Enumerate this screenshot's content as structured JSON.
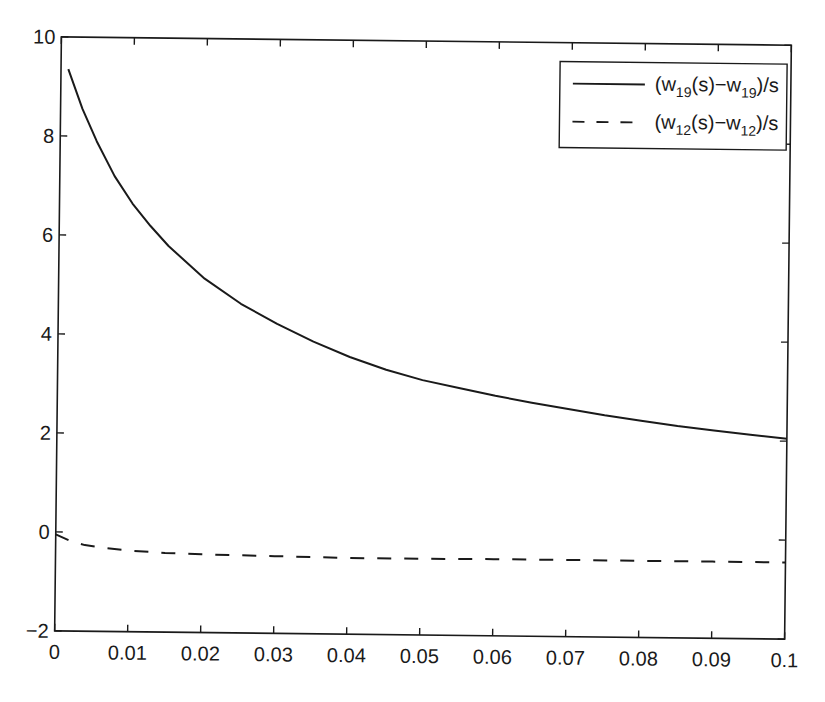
{
  "chart_data": {
    "type": "line",
    "title": "",
    "xlabel": "",
    "ylabel": "",
    "xlim": [
      0,
      0.1
    ],
    "ylim": [
      -2,
      10
    ],
    "grid": false,
    "legend_position": "upper right",
    "x_ticks": [
      "0",
      "0.01",
      "0.02",
      "0.03",
      "0.04",
      "0.05",
      "0.06",
      "0.07",
      "0.08",
      "0.09",
      "0.1"
    ],
    "y_ticks": [
      "-2",
      "0",
      "2",
      "4",
      "6",
      "8",
      "10"
    ],
    "series": [
      {
        "name": "(w19(s)-w19)/s",
        "legend": {
          "pre": "(w",
          "sub1": "19",
          "mid": "(s)−w",
          "sub2": "19",
          "post": ")/s"
        },
        "style": "solid",
        "color": "#1a1a1a",
        "x": [
          0.001,
          0.003,
          0.005,
          0.0075,
          0.01,
          0.0125,
          0.015,
          0.02,
          0.025,
          0.03,
          0.035,
          0.04,
          0.045,
          0.05,
          0.055,
          0.06,
          0.065,
          0.07,
          0.075,
          0.08,
          0.085,
          0.09,
          0.095,
          0.1
        ],
        "values": [
          9.35,
          8.55,
          7.9,
          7.2,
          6.65,
          6.2,
          5.8,
          5.15,
          4.65,
          4.25,
          3.9,
          3.6,
          3.35,
          3.15,
          3.0,
          2.85,
          2.72,
          2.6,
          2.48,
          2.38,
          2.28,
          2.2,
          2.12,
          2.05
        ]
      },
      {
        "name": "(w12(s)-w12)/s",
        "legend": {
          "pre": "(w",
          "sub1": "12",
          "mid": "(s)−w",
          "sub2": "12",
          "post": ")/s"
        },
        "style": "dashed",
        "color": "#1a1a1a",
        "x": [
          0.0,
          0.002,
          0.004,
          0.007,
          0.01,
          0.015,
          0.02,
          0.03,
          0.04,
          0.05,
          0.06,
          0.07,
          0.08,
          0.09,
          0.1
        ],
        "values": [
          -0.05,
          -0.18,
          -0.26,
          -0.32,
          -0.36,
          -0.4,
          -0.42,
          -0.44,
          -0.46,
          -0.46,
          -0.45,
          -0.45,
          -0.45,
          -0.45,
          -0.45
        ]
      }
    ]
  }
}
